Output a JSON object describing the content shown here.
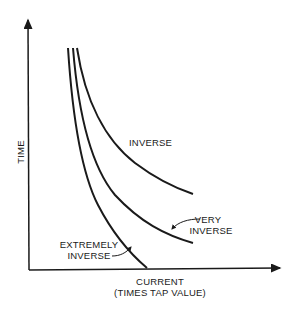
{
  "diagram": {
    "type": "time-current characteristic curves",
    "y_axis_label": "TIME",
    "x_axis_label_line1": "CURRENT",
    "x_axis_label_line2": "(TIMES TAP VALUE)",
    "curves": [
      {
        "name": "inverse",
        "label": "INVERSE"
      },
      {
        "name": "very-inverse",
        "label_line1": "VERY",
        "label_line2": "INVERSE"
      },
      {
        "name": "extremely-inverse",
        "label_line1": "EXTREMELY",
        "label_line2": "INVERSE"
      }
    ],
    "colors": {
      "ink": "#1a1a1a",
      "background": "#ffffff"
    }
  }
}
